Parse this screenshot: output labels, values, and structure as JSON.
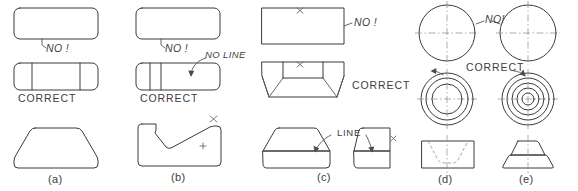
{
  "figure": {
    "background_color": "#ffffff",
    "line_color": "#3a3a3a",
    "centerline_color": "#8b8b8b",
    "hidden_line_color": "#8e8e8e"
  },
  "panels": [
    {
      "id": "a",
      "caption": "(a)",
      "annotations": [
        {
          "name": "no-label",
          "text": "NO !"
        },
        {
          "name": "correct-label",
          "text": "CORRECT"
        }
      ]
    },
    {
      "id": "b",
      "caption": "(b)",
      "annotations": [
        {
          "name": "no-label",
          "text": "NO !"
        },
        {
          "name": "no-line-label",
          "text": "NO LINE"
        },
        {
          "name": "correct-label",
          "text": "CORRECT"
        }
      ]
    },
    {
      "id": "c",
      "caption": "(c)",
      "annotations": [
        {
          "name": "no-label",
          "text": "NO !"
        },
        {
          "name": "correct-label",
          "text": "CORRECT"
        },
        {
          "name": "line-label",
          "text": "LINE"
        }
      ]
    },
    {
      "id": "d",
      "caption": "(d)",
      "annotations": [
        {
          "name": "no-label",
          "text": "NO!"
        },
        {
          "name": "correct-label",
          "text": "CORRECT"
        }
      ]
    },
    {
      "id": "e",
      "caption": "(e)",
      "annotations": []
    }
  ],
  "labels": {
    "a_no": "NO !",
    "a_correct": "CORRECT",
    "a_caption": "(a)",
    "b_no": "NO !",
    "b_no_line": "NO LINE",
    "b_correct": "CORRECT",
    "b_caption": "(b)",
    "c_no": "NO !",
    "c_correct": "CORRECT",
    "c_line": "LINE",
    "c_caption": "(c)",
    "de_no": "NO!",
    "de_correct": "CORRECT",
    "d_caption": "(d)",
    "e_caption": "(e)"
  }
}
